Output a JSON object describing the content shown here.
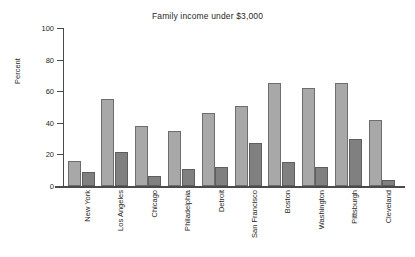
{
  "chart_data": {
    "type": "bar",
    "title": "Family income under $3,000",
    "xlabel": "",
    "ylabel": "Percent",
    "ylim": [
      0,
      100
    ],
    "yticks": [
      0,
      20,
      40,
      60,
      80,
      100
    ],
    "grid": false,
    "legend": "none",
    "categories": [
      "New York",
      "Los Angeles",
      "Chicago",
      "Philadelphia",
      "Detroit",
      "San Francisco",
      "Boston",
      "Washington",
      "Pittsburgh",
      "Cleveland"
    ],
    "series": [
      {
        "name": "series-1",
        "color": "#a8a8a8",
        "values": [
          16,
          55,
          38,
          35,
          46.5,
          50.5,
          65.5,
          62,
          65,
          41.5
        ]
      },
      {
        "name": "series-2",
        "color": "#808080",
        "values": [
          9,
          21.5,
          6.5,
          11,
          12,
          27.5,
          15.5,
          12,
          29.5,
          4
        ]
      }
    ]
  }
}
